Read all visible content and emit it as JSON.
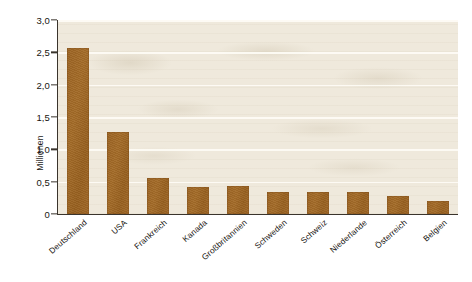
{
  "chart_data": {
    "type": "bar",
    "title": "",
    "subtitle": "",
    "xlabel": "",
    "ylabel": "Millionen",
    "categories": [
      "Deutschland",
      "USA",
      "Frankreich",
      "Kanada",
      "Großbritannien",
      "Schweden",
      "Schweiz",
      "Niederlande",
      "Österreich",
      "Belgien"
    ],
    "values": [
      2.57,
      1.27,
      0.55,
      0.42,
      0.43,
      0.34,
      0.34,
      0.34,
      0.28,
      0.2
    ],
    "ylim": [
      0,
      3.0
    ],
    "ytick_values": [
      0,
      0.5,
      1.0,
      1.5,
      2.0,
      2.5,
      3.0
    ],
    "ytick_labels": [
      "0",
      "0,5",
      "1,0",
      "1,5",
      "2,0",
      "2,5",
      "3,0"
    ],
    "grid": "horizontal",
    "legend": "none",
    "bar_color": "#9c6423",
    "plot_background": "#efe9dc",
    "page_background": "#ffffff",
    "axis_color": "#3a342c",
    "gridline_color": "#fdfbf4"
  }
}
